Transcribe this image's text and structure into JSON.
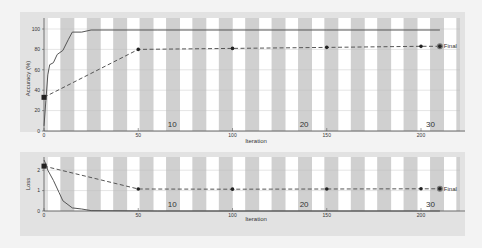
{
  "chart_data": [
    {
      "type": "line",
      "title": "",
      "xlabel": "Iteration",
      "ylabel": "Accuracy (%)",
      "xlim": [
        0,
        215
      ],
      "ylim": [
        0,
        100
      ],
      "xticks": [
        0,
        50,
        100,
        150,
        200
      ],
      "yticks": [
        0,
        20,
        40,
        60,
        80,
        100
      ],
      "grid": true,
      "series": [
        {
          "name": "Training",
          "style": "solid",
          "x": [
            0,
            1,
            2,
            3,
            5,
            7,
            10,
            13,
            15,
            20,
            25,
            60,
            100,
            150,
            200,
            210
          ],
          "y": [
            5,
            30,
            55,
            65,
            67,
            75,
            79,
            90,
            97,
            97,
            99,
            99,
            99,
            99,
            99,
            99
          ]
        },
        {
          "name": "Validation",
          "style": "dashed",
          "x": [
            0,
            50,
            100,
            150,
            200,
            210
          ],
          "y": [
            33,
            80,
            81,
            82,
            83,
            83
          ],
          "final_label": "Final"
        }
      ],
      "annotations": [
        {
          "text": "10",
          "x": 68
        },
        {
          "text": "20",
          "x": 138
        },
        {
          "text": "30",
          "x": 205
        }
      ],
      "background_bands": "alternating gray/white vertical stripes"
    },
    {
      "type": "line",
      "title": "",
      "xlabel": "Iteration",
      "ylabel": "Loss",
      "xlim": [
        0,
        215
      ],
      "ylim": [
        0,
        2.5
      ],
      "xticks": [
        0,
        50,
        100,
        150,
        200
      ],
      "yticks": [
        0,
        1,
        2
      ],
      "grid": true,
      "series": [
        {
          "name": "Training",
          "style": "solid",
          "x": [
            0,
            1,
            2,
            5,
            8,
            10,
            15,
            20,
            25,
            60,
            100,
            150,
            200,
            210
          ],
          "y": [
            2.5,
            2.3,
            2.0,
            1.5,
            0.9,
            0.5,
            0.15,
            0.1,
            0.02,
            0.0,
            0.0,
            0.0,
            0.0,
            0.0
          ]
        },
        {
          "name": "Validation",
          "style": "dashed",
          "x": [
            0,
            50,
            100,
            150,
            200,
            210
          ],
          "y": [
            2.2,
            1.08,
            1.07,
            1.08,
            1.09,
            1.09
          ],
          "final_label": "Final"
        }
      ],
      "annotations": [
        {
          "text": "10",
          "x": 68
        },
        {
          "text": "20",
          "x": 138
        },
        {
          "text": "30",
          "x": 205
        }
      ],
      "background_bands": "alternating gray/white vertical stripes"
    }
  ],
  "colors": {
    "panel": "#e2e2e2",
    "stripe_light": "#ffffff",
    "stripe_dark": "#d0d0d0",
    "line": "#555555",
    "marker": "#222222"
  }
}
